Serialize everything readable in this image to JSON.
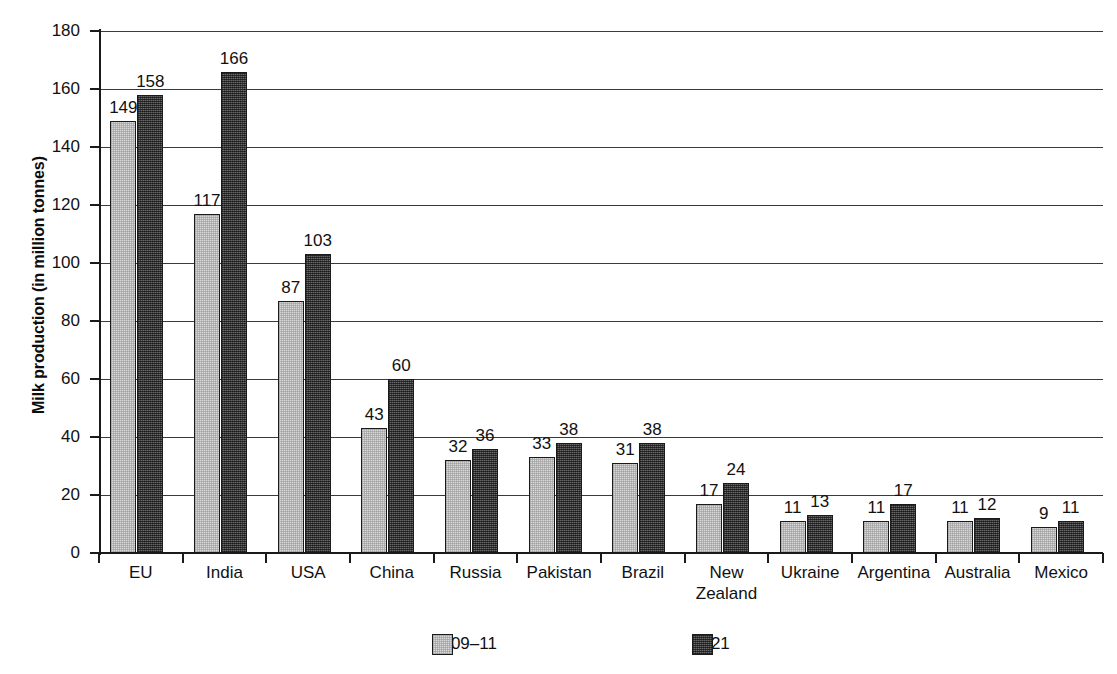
{
  "chart_data": {
    "type": "bar",
    "title": "",
    "subtitle": "",
    "xlabel": "",
    "ylabel": "Milk production (in million tonnes)",
    "ylim": [
      0,
      180
    ],
    "yticks": [
      0,
      20,
      40,
      60,
      80,
      100,
      120,
      140,
      160,
      180
    ],
    "grid": "horizontal",
    "legend_position": "bottom-center",
    "categories": [
      "EU",
      "India",
      "USA",
      "China",
      "Russia",
      "Pakistan",
      "Brazil",
      "New\nZealand",
      "Ukraine",
      "Argentina",
      "Australia",
      "Mexico"
    ],
    "series": [
      {
        "name": "2009–11",
        "color": "#d9d9d9",
        "values": [
          149,
          117,
          87,
          43,
          32,
          33,
          31,
          17,
          11,
          11,
          11,
          9
        ]
      },
      {
        "name": "2021",
        "color": "#4a4a4a",
        "values": [
          158,
          166,
          103,
          60,
          36,
          38,
          38,
          24,
          13,
          17,
          12,
          11
        ]
      }
    ]
  },
  "axis": {
    "y_title": "Milk production (in million tonnes)"
  },
  "legend": {
    "items": [
      {
        "label": "2009–11",
        "swatch": "light-gray-swatch"
      },
      {
        "label": "2021",
        "swatch": "dark-gray-swatch"
      }
    ]
  }
}
